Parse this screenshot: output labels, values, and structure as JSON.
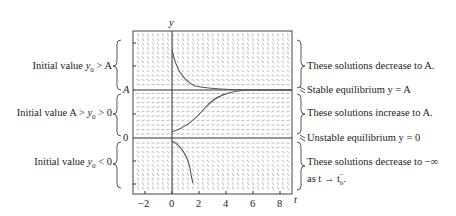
{
  "figure": {
    "axis_labels": {
      "y": "y",
      "t": "t"
    },
    "y_marks": {
      "A": "A",
      "zero": "0"
    },
    "x_ticks": [
      "−2",
      "0",
      "2",
      "4",
      "6",
      "8"
    ],
    "left_annotations": [
      {
        "text_pre": "Initial value ",
        "math": "y",
        "sub": "0",
        "text_post": " > A"
      },
      {
        "text_pre": "Initial value A > ",
        "math": "y",
        "sub": "0",
        "text_post": " > 0"
      },
      {
        "text_pre": "Initial value ",
        "math": "y",
        "sub": "0",
        "text_post": " < 0"
      }
    ],
    "right_annotations": {
      "decrease_to_A": "These solutions decrease to A.",
      "stable": "Stable equilibrium y = A",
      "increase_to_A": "These solutions increase to A.",
      "unstable": "Unstable equilibrium y = 0",
      "decrease_inf_line1": "These solutions decrease to −∞",
      "decrease_inf_line2": "as t → t",
      "decrease_inf_sub": "b",
      "decrease_inf_sup": "−"
    },
    "colors": {
      "line": "#333333",
      "slope": "#9a9a9a",
      "curve": "#555555"
    }
  }
}
